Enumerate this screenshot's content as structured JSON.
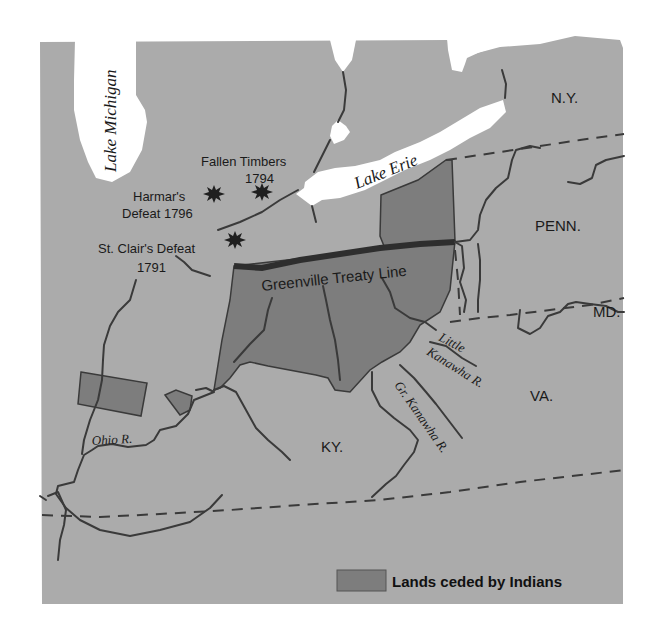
{
  "map": {
    "colors": {
      "land": "#ababab",
      "water": "#ffffff",
      "ceded": "#7d7d7d",
      "treaty_line": "#2e2e2e",
      "ink": "#1a1a1a",
      "background": "#ffffff"
    },
    "lakes": [
      {
        "name": "lake-michigan",
        "label": "Lake Michigan"
      },
      {
        "name": "lake-erie",
        "label": "Lake Erie"
      }
    ],
    "states": [
      {
        "name": "ny",
        "label": "N.Y."
      },
      {
        "name": "penn",
        "label": "PENN."
      },
      {
        "name": "md",
        "label": "MD."
      },
      {
        "name": "va",
        "label": "VA."
      },
      {
        "name": "ky",
        "label": "KY."
      }
    ],
    "rivers": [
      {
        "name": "ohio-river",
        "label": "Ohio R."
      },
      {
        "name": "little-kanawha-river",
        "label_line1": "Little",
        "label_line2": "Kanawha R."
      },
      {
        "name": "great-kanawha-river",
        "label": "Gr. Kanawha R."
      }
    ],
    "battles": [
      {
        "name": "fallen-timbers",
        "label_line1": "Fallen Timbers",
        "label_line2": "1794"
      },
      {
        "name": "harmars-defeat",
        "label_line1": "Harmar's",
        "label_line2": "Defeat 1796"
      },
      {
        "name": "st-clairs-defeat",
        "label_line1": "St. Clair's Defeat",
        "label_line2": "1791"
      }
    ],
    "treaty_line": {
      "label": "Greenville Treaty Line"
    },
    "legend": {
      "items": [
        {
          "swatch_color": "#7d7d7d",
          "label": "Lands ceded by Indians"
        }
      ]
    }
  }
}
